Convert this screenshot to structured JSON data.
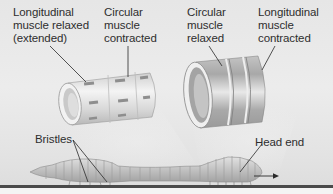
{
  "diagram": {
    "labels": {
      "longitudinal_relaxed": "Longitudinal\nmuscle relaxed\n(extended)",
      "circular_contracted": "Circular\nmuscle\ncontracted",
      "circular_relaxed": "Circular\nmuscle\nrelaxed",
      "longitudinal_contracted": "Longitudinal\nmuscle\ncontracted",
      "bristles": "Bristles",
      "head_end": "Head end"
    },
    "direction_arrow": "→",
    "colors": {
      "background": "#e8e8e8",
      "ground_line": "#4a4a4a",
      "worm_body": "#bdbdbd",
      "leader_line": "#2a2a2a"
    },
    "segments": [
      {
        "name": "elongated-segment",
        "state": "Longitudinal muscle relaxed, circular muscle contracted"
      },
      {
        "name": "shortened-segment",
        "state": "Circular muscle relaxed, longitudinal muscle contracted"
      }
    ]
  }
}
